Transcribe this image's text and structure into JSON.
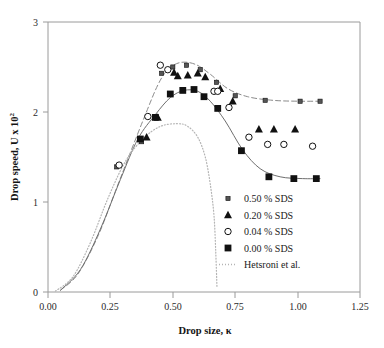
{
  "chart_data": {
    "type": "scatter",
    "title": "",
    "xlabel": "Drop size, κ",
    "ylabel": "Drop speed, U x 10",
    "ylabel_exponent": "2",
    "xlim": [
      0.0,
      1.25
    ],
    "ylim": [
      0,
      3
    ],
    "xticks": [
      "0.00",
      "0.25",
      "0.50",
      "0.75",
      "1.00",
      "1.25"
    ],
    "xtick_values": [
      0.0,
      0.25,
      0.5,
      0.75,
      1.0,
      1.25
    ],
    "yticks": [
      "0",
      "1",
      "2",
      "3"
    ],
    "ytick_values": [
      0,
      1,
      2,
      3
    ],
    "grid": false,
    "legend_position": "inside-lower-right",
    "series": [
      {
        "name": "0.50 % SDS",
        "marker": "small-filled-square",
        "legend_label": "0.50 % SDS",
        "points": [
          [
            0.275,
            1.39
          ],
          [
            0.375,
            1.67
          ],
          [
            0.455,
            2.43
          ],
          [
            0.5,
            2.5
          ],
          [
            0.555,
            2.52
          ],
          [
            0.61,
            2.47
          ],
          [
            0.675,
            2.33
          ],
          [
            0.75,
            2.18
          ],
          [
            0.87,
            2.13
          ],
          [
            1.01,
            2.12
          ],
          [
            1.09,
            2.12
          ]
        ]
      },
      {
        "name": "0.20 % SDS",
        "marker": "filled-triangle",
        "legend_label": "0.20 % SDS",
        "points": [
          [
            0.395,
            1.72
          ],
          [
            0.44,
            1.94
          ],
          [
            0.505,
            2.44
          ],
          [
            0.52,
            2.4
          ],
          [
            0.56,
            2.41
          ],
          [
            0.6,
            2.43
          ],
          [
            0.63,
            2.39
          ],
          [
            0.69,
            2.26
          ],
          [
            0.74,
            2.12
          ],
          [
            0.845,
            1.81
          ],
          [
            0.905,
            1.81
          ],
          [
            0.99,
            1.81
          ]
        ]
      },
      {
        "name": "0.04 % SDS",
        "marker": "open-circle",
        "legend_label": "0.04 % SDS",
        "points": [
          [
            0.285,
            1.41
          ],
          [
            0.4,
            1.95
          ],
          [
            0.45,
            2.52
          ],
          [
            0.48,
            2.47
          ],
          [
            0.665,
            2.23
          ],
          [
            0.68,
            2.23
          ],
          [
            0.725,
            2.05
          ],
          [
            0.805,
            1.72
          ],
          [
            0.88,
            1.64
          ],
          [
            0.945,
            1.64
          ],
          [
            1.06,
            1.62
          ]
        ]
      },
      {
        "name": "0.00 % SDS",
        "marker": "filled-square",
        "legend_label": "0.00 % SDS",
        "points": [
          [
            0.37,
            1.7
          ],
          [
            0.43,
            1.94
          ],
          [
            0.49,
            2.2
          ],
          [
            0.54,
            2.24
          ],
          [
            0.585,
            2.25
          ],
          [
            0.625,
            2.17
          ],
          [
            0.68,
            2.04
          ],
          [
            0.775,
            1.57
          ],
          [
            0.885,
            1.28
          ],
          [
            0.985,
            1.26
          ],
          [
            1.075,
            1.26
          ]
        ]
      }
    ],
    "curves": [
      {
        "name": "0.50 % SDS fit",
        "style": "dashed",
        "points": [
          [
            0.05,
            0.02
          ],
          [
            0.12,
            0.2
          ],
          [
            0.2,
            0.62
          ],
          [
            0.27,
            1.12
          ],
          [
            0.33,
            1.55
          ],
          [
            0.39,
            1.97
          ],
          [
            0.44,
            2.3
          ],
          [
            0.48,
            2.47
          ],
          [
            0.53,
            2.55
          ],
          [
            0.59,
            2.53
          ],
          [
            0.65,
            2.42
          ],
          [
            0.72,
            2.26
          ],
          [
            0.8,
            2.17
          ],
          [
            0.9,
            2.13
          ],
          [
            1.0,
            2.12
          ],
          [
            1.1,
            2.12
          ]
        ]
      },
      {
        "name": "0.00 % SDS fit",
        "style": "solid",
        "points": [
          [
            0.05,
            0.02
          ],
          [
            0.13,
            0.25
          ],
          [
            0.21,
            0.7
          ],
          [
            0.29,
            1.25
          ],
          [
            0.36,
            1.7
          ],
          [
            0.43,
            1.97
          ],
          [
            0.49,
            2.16
          ],
          [
            0.545,
            2.24
          ],
          [
            0.6,
            2.23
          ],
          [
            0.65,
            2.12
          ],
          [
            0.71,
            1.9
          ],
          [
            0.78,
            1.58
          ],
          [
            0.85,
            1.37
          ],
          [
            0.93,
            1.28
          ],
          [
            1.02,
            1.26
          ],
          [
            1.09,
            1.26
          ]
        ]
      },
      {
        "name": "Hetsroni et al.",
        "style": "dotted",
        "legend_label": "Hetsroni et al.",
        "points": [
          [
            0.03,
            0.01
          ],
          [
            0.1,
            0.17
          ],
          [
            0.17,
            0.55
          ],
          [
            0.24,
            1.04
          ],
          [
            0.31,
            1.45
          ],
          [
            0.38,
            1.7
          ],
          [
            0.45,
            1.84
          ],
          [
            0.52,
            1.87
          ],
          [
            0.56,
            1.84
          ],
          [
            0.6,
            1.72
          ],
          [
            0.63,
            1.5
          ],
          [
            0.65,
            1.2
          ],
          [
            0.665,
            0.85
          ],
          [
            0.672,
            0.45
          ],
          [
            0.677,
            0.05
          ]
        ]
      }
    ],
    "legend_items": [
      {
        "label": "0.50 % SDS",
        "marker": "small-filled-square"
      },
      {
        "label": "0.20 % SDS",
        "marker": "filled-triangle"
      },
      {
        "label": "0.04 % SDS",
        "marker": "open-circle"
      },
      {
        "label": "0.00 % SDS",
        "marker": "filled-square"
      },
      {
        "label": "Hetsroni et al.",
        "marker": "dotted-line"
      }
    ],
    "colors": {
      "marker": "#111111",
      "axis": "#9a9a9a",
      "curve_solid": "#6e6e6e",
      "curve_dashed": "#8a8a8a",
      "curve_dotted": "#b4b4b4",
      "text": "#1a1a1a",
      "background": "#ffffff"
    }
  }
}
